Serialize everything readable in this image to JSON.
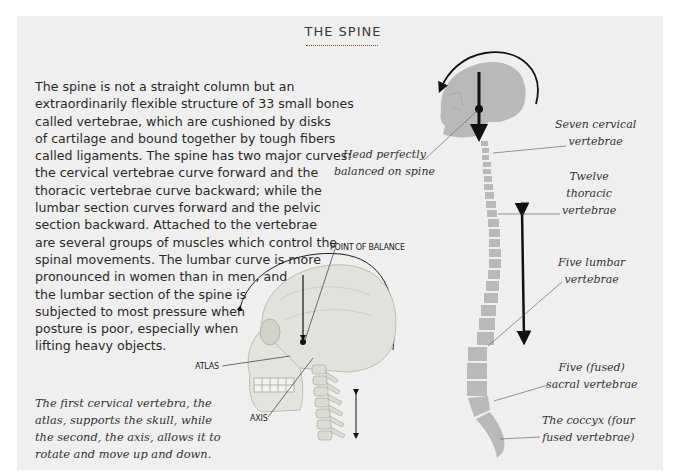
{
  "title": "THE SPINE",
  "body_lines": [
    "The spine is not a straight column but an",
    "extraordinarily flexible structure of 33 small bones",
    "called vertebrae, which are cushioned by disks",
    "of cartilage and bound together by tough fibers",
    "called ligaments. The spine has two major curves:",
    "the cervical vertebrae curve forward and the",
    "thoracic vertebrae curve backward; while the",
    "lumbar section curves forward and the pelvic",
    "section backward. Attached to the vertebrae",
    "are several groups of muscles which control the",
    "spinal movements. The lumbar curve is more",
    "pronounced in women than in men, and",
    "the lumbar section of the spine is",
    "subjected to most pressure when",
    "posture is poor, especially when",
    "lifting heavy objects."
  ],
  "caption_lines": [
    "The first cervical vertebra, the",
    "atlas, supports the skull, while",
    "the second, the axis, allows it to",
    "rotate and move up and down."
  ],
  "skull_labels": {
    "point_of_balance": "POINT OF BALANCE",
    "atlas": "ATLAS",
    "axis": "AXIS"
  },
  "spine_labels": {
    "head_balanced": [
      "Head perfectly",
      "balanced on spine"
    ],
    "cervical": [
      "Seven cervical",
      "vertebrae"
    ],
    "thoracic": [
      "Twelve",
      "thoracic",
      "vertebrae"
    ],
    "lumbar": [
      "Five lumbar",
      "vertebrae"
    ],
    "sacral": [
      "Five (fused)",
      "sacral vertebrae"
    ],
    "coccyx": [
      "The coccyx (four",
      "fused vertebrae)"
    ]
  },
  "colors": {
    "background": "#efefef",
    "title_rule": "#b23a1e",
    "silhouette": "#b9b9b9",
    "arrow": "#111111"
  }
}
